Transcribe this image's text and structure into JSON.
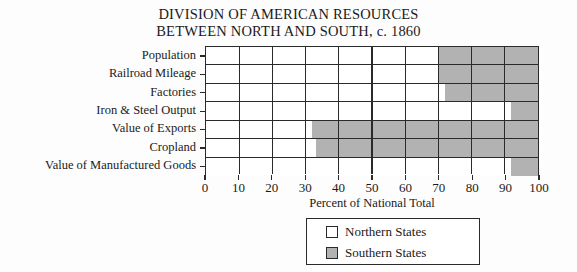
{
  "chart_data": {
    "type": "bar",
    "orientation": "horizontal",
    "stacked": true,
    "title": "DIVISION OF AMERICAN RESOURCES BETWEEN NORTH AND SOUTH, c. 1860",
    "title_line1": "DIVISION OF AMERICAN RESOURCES",
    "title_line2": "BETWEEN NORTH AND SOUTH, c. 1860",
    "xlabel": "Percent of National Total",
    "ylabel": "",
    "xlim": [
      0,
      100
    ],
    "xticks": [
      0,
      10,
      20,
      30,
      40,
      50,
      60,
      70,
      80,
      90,
      100
    ],
    "xticklabels": [
      "0",
      "10",
      "20",
      "30",
      "40",
      "50",
      "60",
      "70",
      "80",
      "90",
      "100"
    ],
    "grid": true,
    "legend_position": "bottom-center",
    "categories": [
      "Population",
      "Railroad Mileage",
      "Factories",
      "Iron & Steel Output",
      "Value of Exports",
      "Cropland",
      "Value of Manufactured Goods"
    ],
    "series": [
      {
        "name": "Northern States",
        "color": "#ffffff",
        "values": [
          70,
          70,
          72,
          92,
          32,
          33,
          92
        ]
      },
      {
        "name": "Southern States",
        "color": "#b2b2b2",
        "values": [
          30,
          30,
          28,
          8,
          68,
          67,
          8
        ]
      }
    ]
  },
  "legend": {
    "items": [
      {
        "label": "Northern States",
        "swatch": "north"
      },
      {
        "label": "Southern States",
        "swatch": "south"
      }
    ]
  },
  "colors": {
    "north_fill": "#ffffff",
    "south_fill": "#b2b2b2",
    "line": "#2a2a2a",
    "background": "#fdfdfd"
  }
}
